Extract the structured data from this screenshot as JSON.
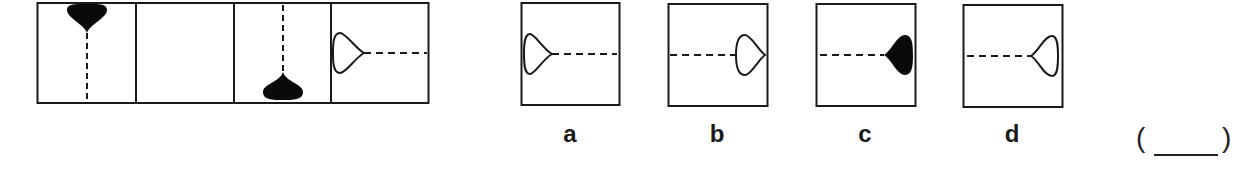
{
  "puzzle": {
    "type": "figure-sequence",
    "sequence": [
      {
        "index": 1,
        "shape": "teardrop",
        "fill": "black",
        "head_position": "top",
        "line_direction": "down"
      },
      {
        "index": 2,
        "shape": "empty"
      },
      {
        "index": 3,
        "shape": "teardrop",
        "fill": "black",
        "head_position": "bottom",
        "line_direction": "up"
      },
      {
        "index": 4,
        "shape": "teardrop",
        "fill": "white",
        "head_position": "left",
        "line_direction": "right"
      }
    ],
    "options": [
      {
        "label": "a",
        "shape": "teardrop",
        "fill": "white",
        "head_position": "left",
        "line_direction": "right"
      },
      {
        "label": "b",
        "shape": "teardrop",
        "fill": "white",
        "head_position": "right",
        "line_direction": "left"
      },
      {
        "label": "c",
        "shape": "teardrop",
        "fill": "black",
        "head_position": "right",
        "line_direction": "left"
      },
      {
        "label": "d",
        "shape": "teardrop",
        "fill": "white",
        "head_position": "right",
        "line_direction": "left"
      }
    ],
    "answer_blank": {
      "open": "(",
      "close": ")",
      "value": ""
    }
  },
  "colors": {
    "stroke": "#1a1a1a",
    "fill_black": "#0a0a0a",
    "background": "#ffffff"
  }
}
